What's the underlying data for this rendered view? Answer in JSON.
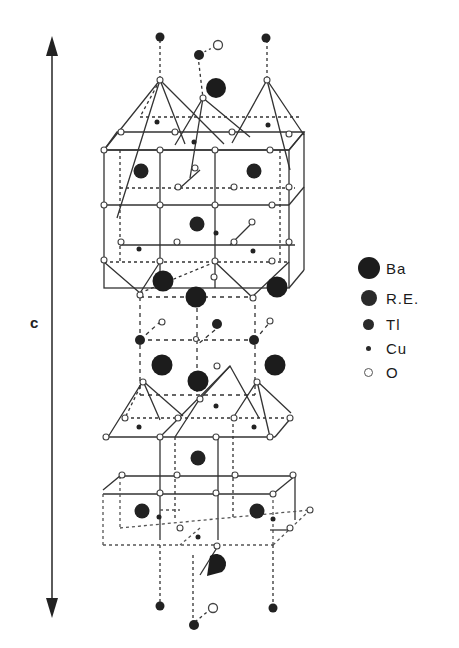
{
  "figure": {
    "axis": {
      "label": "c",
      "direction": "vertical double-headed arrow"
    }
  },
  "legend": {
    "items": [
      {
        "label": "Ba",
        "symbol": "large-filled-circle",
        "size": 22,
        "color": "#1c1c1c"
      },
      {
        "label": "R.E.",
        "symbol": "medium-filled-circle",
        "size": 16,
        "color": "#2a2a2a"
      },
      {
        "label": "Tl",
        "symbol": "small-filled-circle",
        "size": 12,
        "color": "#2a2a2a"
      },
      {
        "label": "Cu",
        "symbol": "tiny-filled-circle",
        "size": 6,
        "color": "#2a2a2a"
      },
      {
        "label": "O",
        "symbol": "open-circle",
        "size": 9,
        "color": "#555555"
      }
    ]
  },
  "colors": {
    "ink": "#1c1c1c",
    "line": "#333333",
    "background": "#ffffff"
  }
}
